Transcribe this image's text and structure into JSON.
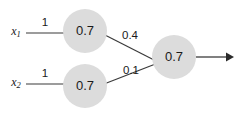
{
  "diagram": {
    "background_color": "#ffffff",
    "node_fill_color": "#dcdcdc",
    "edge_color": "#3a3a3a",
    "text_color": "#1a1a1a"
  },
  "inputs": [
    {
      "name": "x1",
      "base": "x",
      "subscript": "1",
      "weight": "1"
    },
    {
      "name": "x2",
      "base": "x",
      "subscript": "2",
      "weight": "1"
    }
  ],
  "hidden_nodes": [
    {
      "name": "hidden-node-top",
      "value": "0.7"
    },
    {
      "name": "hidden-node-bottom",
      "value": "0.7"
    }
  ],
  "output_node": {
    "name": "output-node",
    "value": "0.7"
  },
  "hidden_to_output_weights": [
    {
      "name": "weight-top-to-output",
      "value": "0.4"
    },
    {
      "name": "weight-bottom-to-output",
      "value": "0.1"
    }
  ],
  "output_arrow": {
    "name": "output-arrow",
    "label": ""
  }
}
